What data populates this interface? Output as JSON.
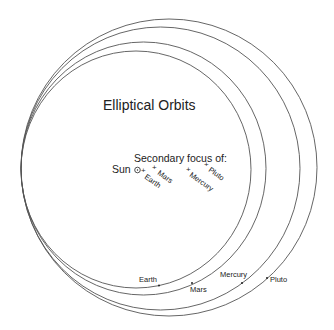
{
  "title": "Elliptical Orbits",
  "focus_heading": "Secondary focus of:",
  "sun_label": "Sun",
  "sun_symbol": "⊙",
  "focus_marker": "+",
  "colors": {
    "orbit": "#555555",
    "text": "#222222",
    "background": "#ffffff"
  },
  "orbits": [
    {
      "name": "Earth",
      "cx": 136,
      "cy": 169.5,
      "rx": 115,
      "ry": 118.5
    },
    {
      "name": "Mars",
      "cx": 143.5,
      "cy": 168.5,
      "rx": 122.5,
      "ry": 126.5
    },
    {
      "name": "Mercury",
      "cx": 160.5,
      "cy": 168.5,
      "rx": 139.5,
      "ry": 141.5
    },
    {
      "name": "Pluto",
      "cx": 169,
      "cy": 167.5,
      "rx": 148,
      "ry": 148.5
    }
  ],
  "secondary_foci": [
    {
      "name": "Earth",
      "label": "Earth"
    },
    {
      "name": "Mars",
      "label": "Mars"
    },
    {
      "name": "Mercury",
      "label": "Mercury"
    },
    {
      "name": "Pluto",
      "label": "Pluto"
    }
  ],
  "planet_positions": [
    {
      "name": "Earth",
      "label": "Earth"
    },
    {
      "name": "Mars",
      "label": "Mars"
    },
    {
      "name": "Mercury",
      "label": "Mercury"
    },
    {
      "name": "Pluto",
      "label": "Pluto"
    }
  ]
}
